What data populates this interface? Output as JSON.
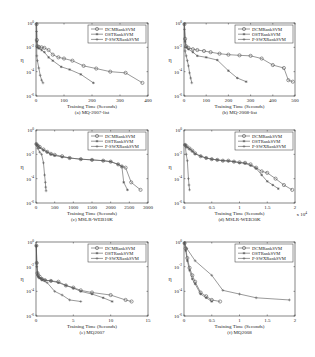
{
  "figure": {
    "legend_entries": [
      "DCMRankSVM",
      "OSTRankSVM",
      "P-SWXRankSVM"
    ]
  },
  "chart_data": [
    {
      "type": "line",
      "panel": "a",
      "caption": "(a) MQ-2007-list",
      "xlabel": "Training Time (Seconds)",
      "ylabel": "η",
      "yscale": "log",
      "xlim": [
        0,
        400
      ],
      "ylim": [
        1e-06,
        1
      ],
      "xticks": [
        0,
        100,
        200,
        300,
        400
      ],
      "xtick_labels": [
        "0",
        "100",
        "200",
        "300",
        "400"
      ],
      "yticks": [
        1,
        0.01,
        0.0001,
        1e-06
      ],
      "ytick_labels": [
        "10^0",
        "10^-2",
        "10^-4",
        "10^-6"
      ],
      "x_multiplier": "",
      "legend_position": "top-right",
      "series": [
        {
          "name": "DCMRankSVM",
          "marker": "circle",
          "x": [
            2,
            3,
            5,
            10,
            20,
            30,
            45,
            60,
            80,
            100,
            130,
            170,
            215,
            265,
            320,
            380
          ],
          "y": [
            0.8,
            0.04,
            0.012,
            0.011,
            0.01,
            0.009,
            0.006,
            0.0025,
            0.0015,
            0.0012,
            0.0008,
            0.0003,
            0.00018,
            0.0001,
            8e-05,
            1.2e-05
          ]
        },
        {
          "name": "OSTRankSVM",
          "marker": "star",
          "x": [
            2,
            3,
            5,
            10,
            20,
            30,
            45,
            60,
            90,
            120,
            160,
            205
          ],
          "y": [
            0.8,
            0.03,
            0.01,
            0.008,
            0.006,
            0.004,
            0.0015,
            0.0008,
            0.00025,
            0.00015,
            6e-05,
            1.2e-05
          ]
        },
        {
          "name": "P-SWXRankSVM",
          "marker": "plus",
          "x": [
            2,
            3,
            5,
            10,
            15,
            20,
            25
          ],
          "y": [
            0.2,
            0.002,
            0.0008,
            0.0002,
            5e-05,
            2e-05,
            1.2e-05
          ]
        }
      ]
    },
    {
      "type": "line",
      "panel": "b",
      "caption": "(b) MQ-2008-list",
      "xlabel": "Training Time (Seconds)",
      "ylabel": "η",
      "yscale": "log",
      "xlim": [
        0,
        500
      ],
      "ylim": [
        1e-06,
        1
      ],
      "xticks": [
        0,
        100,
        200,
        300,
        400,
        500
      ],
      "xtick_labels": [
        "0",
        "100",
        "200",
        "300",
        "400",
        "500"
      ],
      "yticks": [
        1,
        0.01,
        0.0001,
        1e-06
      ],
      "ytick_labels": [
        "10^0",
        "10^-2",
        "10^-4",
        "10^-6"
      ],
      "x_multiplier": "",
      "legend_position": "top-right",
      "series": [
        {
          "name": "DCMRankSVM",
          "marker": "circle",
          "x": [
            2,
            5,
            10,
            20,
            40,
            60,
            90,
            120,
            160,
            200,
            250,
            300,
            350,
            400,
            450,
            470,
            490
          ],
          "y": [
            0.8,
            0.05,
            0.012,
            0.009,
            0.007,
            0.006,
            0.005,
            0.004,
            0.003,
            0.0025,
            0.0022,
            0.002,
            0.0012,
            0.00035,
            0.0002,
            2e-05,
            1.5e-05
          ]
        },
        {
          "name": "OSTRankSVM",
          "marker": "star",
          "x": [
            2,
            5,
            10,
            20,
            40,
            60,
            100,
            150,
            200,
            240,
            280
          ],
          "y": [
            0.8,
            0.03,
            0.01,
            0.007,
            0.004,
            0.002,
            0.0015,
            0.0009,
            0.00012,
            3e-05,
            1.5e-05
          ]
        },
        {
          "name": "P-SWXRankSVM",
          "marker": "plus",
          "x": [
            2,
            5,
            10,
            15,
            20,
            25,
            30,
            35
          ],
          "y": [
            0.3,
            0.005,
            0.002,
            0.0008,
            0.0003,
            8e-05,
            3e-05,
            1.2e-05
          ]
        }
      ]
    },
    {
      "type": "line",
      "panel": "c",
      "caption": "(c) MSLR-WEB10K",
      "xlabel": "Training Time (Seconds)",
      "ylabel": "η",
      "yscale": "log",
      "xlim": [
        0,
        3000
      ],
      "ylim": [
        1e-06,
        1
      ],
      "xticks": [
        0,
        500,
        1000,
        1500,
        2000,
        2500,
        3000
      ],
      "xtick_labels": [
        "0",
        "500",
        "1000",
        "1500",
        "2000",
        "2500",
        "3000"
      ],
      "yticks": [
        1,
        0.01,
        0.0001,
        1e-06
      ],
      "ytick_labels": [
        "10^0",
        "10^-2",
        "10^-4",
        "10^-6"
      ],
      "x_multiplier": "",
      "legend_position": "top-right",
      "series": [
        {
          "name": "DCMRankSVM",
          "marker": "circle",
          "x": [
            10,
            50,
            100,
            200,
            300,
            400,
            500,
            700,
            900,
            1200,
            1500,
            1800,
            2000,
            2200,
            2300,
            2400,
            2550,
            2800
          ],
          "y": [
            0.07,
            0.05,
            0.04,
            0.025,
            0.016,
            0.011,
            0.009,
            0.007,
            0.005,
            0.004,
            0.0035,
            0.003,
            0.0025,
            0.0015,
            0.001,
            0.0008,
            5e-05,
            1.2e-05
          ]
        },
        {
          "name": "OSTRankSVM",
          "marker": "star",
          "x": [
            10,
            50,
            100,
            200,
            300,
            400,
            500,
            700,
            900,
            1200,
            1500,
            1800,
            2000,
            2200,
            2300,
            2350,
            2450
          ],
          "y": [
            0.07,
            0.05,
            0.035,
            0.022,
            0.015,
            0.01,
            0.008,
            0.006,
            0.005,
            0.004,
            0.0035,
            0.003,
            0.0025,
            0.0015,
            0.001,
            5e-05,
            1.2e-05
          ]
        },
        {
          "name": "P-SWXRankSVM",
          "marker": "plus",
          "x": [
            10,
            50,
            100,
            150,
            200,
            230,
            250,
            260,
            270
          ],
          "y": [
            0.07,
            0.03,
            0.015,
            0.01,
            0.002,
            0.0002,
            5e-05,
            2e-05,
            1e-05
          ]
        }
      ]
    },
    {
      "type": "line",
      "panel": "d",
      "caption": "(d) MSLR-WEB30K",
      "xlabel": "Training Time (Seconds)",
      "ylabel": "η",
      "yscale": "log",
      "xlim": [
        0,
        2
      ],
      "ylim": [
        1e-06,
        1
      ],
      "xticks": [
        0,
        0.5,
        1,
        1.5,
        2
      ],
      "xtick_labels": [
        "0",
        "0.5",
        "1",
        "1.5",
        "2"
      ],
      "yticks": [
        1,
        0.01,
        0.0001,
        1e-06
      ],
      "ytick_labels": [
        "10^0",
        "10^-2",
        "10^-4",
        "10^-6"
      ],
      "x_multiplier": "x 10^4",
      "legend_position": "top-right",
      "series": [
        {
          "name": "DCMRankSVM",
          "marker": "circle",
          "x": [
            0.02,
            0.05,
            0.1,
            0.15,
            0.2,
            0.3,
            0.4,
            0.5,
            0.6,
            0.7,
            0.8,
            0.9,
            1.0,
            1.1,
            1.2,
            1.3,
            1.4,
            1.5,
            1.65,
            1.8,
            1.95
          ],
          "y": [
            0.06,
            0.045,
            0.03,
            0.02,
            0.012,
            0.007,
            0.005,
            0.004,
            0.0035,
            0.003,
            0.003,
            0.0025,
            0.0022,
            0.002,
            0.0015,
            0.0008,
            0.0004,
            0.0003,
            0.0001,
            3e-05,
            1.2e-05
          ]
        },
        {
          "name": "OSTRankSVM",
          "marker": "star",
          "x": [
            0.02,
            0.05,
            0.1,
            0.15,
            0.2,
            0.3,
            0.4,
            0.5,
            0.6,
            0.7,
            0.8,
            0.9,
            1.0,
            1.1,
            1.2,
            1.3,
            1.4,
            1.5,
            1.6,
            1.7
          ],
          "y": [
            0.06,
            0.04,
            0.028,
            0.018,
            0.011,
            0.007,
            0.005,
            0.004,
            0.0035,
            0.003,
            0.0028,
            0.0025,
            0.002,
            0.0018,
            0.0012,
            0.0007,
            0.0002,
            6e-05,
            3e-05,
            1.5e-05
          ]
        },
        {
          "name": "P-SWXRankSVM",
          "marker": "plus",
          "x": [
            0.02,
            0.04,
            0.06,
            0.08,
            0.09,
            0.1
          ],
          "y": [
            0.06,
            0.01,
            0.003,
            0.0001,
            3e-05,
            1.2e-05
          ]
        }
      ]
    },
    {
      "type": "line",
      "panel": "e",
      "caption": "(e) MQ2007",
      "xlabel": "Training Time (Seconds)",
      "ylabel": "η",
      "yscale": "log",
      "xlim": [
        0,
        15
      ],
      "ylim": [
        1e-06,
        1
      ],
      "xticks": [
        0,
        5,
        10,
        15
      ],
      "xtick_labels": [
        "0",
        "5",
        "10",
        "15"
      ],
      "yticks": [
        1,
        0.01,
        0.0001,
        1e-06
      ],
      "ytick_labels": [
        "10^0",
        "10^-2",
        "10^-4",
        "10^-6"
      ],
      "x_multiplier": "",
      "legend_position": "top-right",
      "series": [
        {
          "name": "DCMRankSVM",
          "marker": "circle",
          "x": [
            0.05,
            0.1,
            0.2,
            0.3,
            0.5,
            0.8,
            1.2,
            2,
            3,
            4,
            5,
            6,
            7.5,
            10,
            12,
            12.8
          ],
          "y": [
            0.5,
            0.02,
            0.003,
            0.002,
            0.0015,
            0.001,
            0.0008,
            0.0007,
            0.0006,
            0.0003,
            0.0002,
            0.00012,
            8e-05,
            5e-05,
            2e-05,
            1.5e-05
          ]
        },
        {
          "name": "OSTRankSVM",
          "marker": "star",
          "x": [
            0.05,
            0.1,
            0.2,
            0.3,
            0.5,
            0.8,
            1.2,
            2,
            3,
            4,
            5,
            6,
            7.5,
            9,
            10.2
          ],
          "y": [
            0.5,
            0.02,
            0.003,
            0.0015,
            0.0012,
            0.001,
            0.0008,
            0.0007,
            0.0005,
            0.0003,
            0.00018,
            0.0001,
            6e-05,
            3e-05,
            1.5e-05
          ]
        },
        {
          "name": "P-SWXRankSVM",
          "marker": "plus",
          "x": [
            0.05,
            0.1,
            0.2,
            0.4,
            0.8,
            1.5,
            2.5,
            3.5,
            4.5,
            6
          ],
          "y": [
            0.5,
            0.01,
            0.002,
            0.0012,
            0.0008,
            0.0005,
            0.0001,
            5e-05,
            2e-05,
            1.5e-05
          ]
        }
      ]
    },
    {
      "type": "line",
      "panel": "f",
      "caption": "(f) MQ2008",
      "xlabel": "Training Time (Seconds)",
      "ylabel": "η",
      "yscale": "log",
      "xlim": [
        0,
        2
      ],
      "ylim": [
        1e-06,
        1
      ],
      "xticks": [
        0,
        0.5,
        1,
        1.5,
        2
      ],
      "xtick_labels": [
        "0",
        "0.5",
        "1",
        "1.5",
        "2"
      ],
      "yticks": [
        1,
        0.01,
        0.0001,
        1e-06
      ],
      "ytick_labels": [
        "10^0",
        "10^-2",
        "10^-4",
        "10^-6"
      ],
      "x_multiplier": "",
      "legend_position": "top-right",
      "series": [
        {
          "name": "DCMRankSVM",
          "marker": "circle",
          "x": [
            0.01,
            0.03,
            0.06,
            0.1,
            0.15,
            0.2,
            0.3,
            0.4,
            0.5,
            0.65
          ],
          "y": [
            0.8,
            0.3,
            0.05,
            0.008,
            0.002,
            0.0006,
            8e-05,
            4e-05,
            2e-05,
            1.5e-05
          ]
        },
        {
          "name": "OSTRankSVM",
          "marker": "star",
          "x": [
            0.01,
            0.03,
            0.06,
            0.1,
            0.15,
            0.2,
            0.3,
            0.4,
            0.5
          ],
          "y": [
            0.8,
            0.2,
            0.03,
            0.005,
            0.001,
            0.0004,
            6e-05,
            3e-05,
            1.5e-05
          ]
        },
        {
          "name": "P-SWXRankSVM",
          "marker": "plus",
          "x": [
            0.01,
            0.05,
            0.2,
            0.5,
            0.7,
            1.0,
            1.3,
            1.9
          ],
          "y": [
            0.8,
            0.3,
            0.03,
            0.002,
            0.00012,
            6e-05,
            3e-05,
            2e-05
          ]
        }
      ]
    }
  ]
}
